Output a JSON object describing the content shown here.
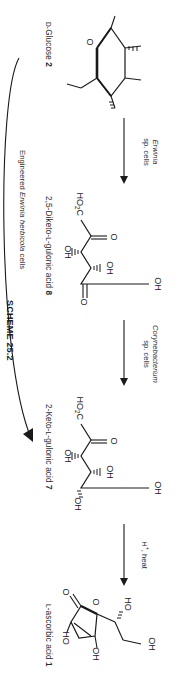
{
  "scheme": {
    "title": "SCHEME 25.2",
    "caption": "Engineered Erwinia herbicola cells",
    "caption_italic_part": "Erwinia herbicola",
    "caption_prefix": "Engineered ",
    "caption_suffix": " cells"
  },
  "compounds": [
    {
      "id": "glucose",
      "name": "D-Glucose 2",
      "prefix": "D-",
      "base": "Glucose ",
      "number": "2",
      "atoms": [
        "OH",
        "OH",
        "OH",
        "OH",
        "O",
        "HO"
      ]
    },
    {
      "id": "diketo",
      "name": "2,5-Diketo-L-gulonic acid 8",
      "prefix": "2,5-Diketo-",
      "small": "L",
      "base": "-gulonic acid ",
      "number": "8",
      "atoms": [
        "HO2C",
        "O",
        "OH",
        "OH",
        "O",
        "OH"
      ]
    },
    {
      "id": "ketogulonic",
      "name": "2-Keto-L-gulonic acid 7",
      "prefix": "2-Keto-",
      "small": "L",
      "base": "-gulonic acid ",
      "number": "7",
      "atoms": [
        "HO2C",
        "O",
        "OH",
        "OH",
        "OH",
        "OH"
      ]
    },
    {
      "id": "ascorbic",
      "name": "L-ascorbic acid 1",
      "prefix": "",
      "small": "L",
      "base": "-ascorbic acid ",
      "number": "1",
      "atoms": [
        "OH",
        "OH",
        "O",
        "O",
        "HO",
        "HO"
      ]
    }
  ],
  "arrows": [
    {
      "id": "arrow-1",
      "line1": "Erwinia",
      "line2": "sp. cells",
      "italic_line": "Erwinia"
    },
    {
      "id": "arrow-2",
      "line1": "Corynebacterium",
      "line2": "sp. cells",
      "italic_line": "Corynebacterium"
    },
    {
      "id": "arrow-3",
      "line1": "H+, heat",
      "line2": "",
      "italic_line": ""
    }
  ],
  "colors": {
    "ink": "#1a1a1a",
    "text": "#2b2b2b",
    "background": "#ffffff"
  }
}
